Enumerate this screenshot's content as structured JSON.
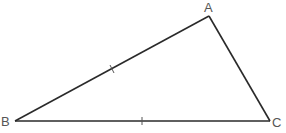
{
  "diagram": {
    "type": "triangle",
    "stroke_color": "#2a2a2a",
    "label_color": "#555555",
    "vertices": [
      {
        "name": "A",
        "x": 209,
        "y": 16,
        "label_x": 204,
        "label_y": 0
      },
      {
        "name": "B",
        "x": 15,
        "y": 121,
        "label_x": 1,
        "label_y": 115
      },
      {
        "name": "C",
        "x": 270,
        "y": 121,
        "label_x": 272,
        "label_y": 116
      }
    ],
    "sides": [
      "AB",
      "BC",
      "CA"
    ],
    "equal_marks": [
      {
        "side": "AB",
        "marks": 1
      },
      {
        "side": "BC",
        "marks": 1
      }
    ]
  }
}
